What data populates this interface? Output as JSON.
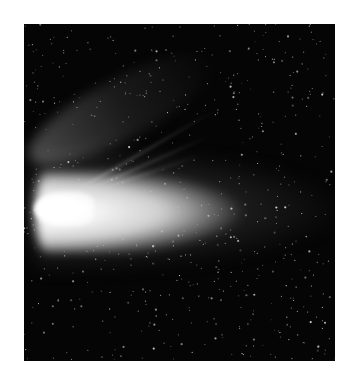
{
  "image": {
    "subject": "comet",
    "description": "Bright comet with broad white dust tail and faint ion tail streaks against a dark starfield",
    "frame": {
      "x": 24,
      "y": 24,
      "width": 311,
      "height": 337
    },
    "colors": {
      "background": "#ffffff",
      "sky": "#050505",
      "coma": "#ffffff",
      "tail": "#cfcfcf"
    },
    "stars": {
      "count": 650,
      "seed": 7
    }
  }
}
